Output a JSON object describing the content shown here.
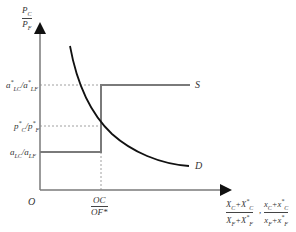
{
  "diagram": {
    "y_axis": {
      "label_num": "P",
      "label_num_sub": "C",
      "label_den": "P",
      "label_den_sub": "F"
    },
    "x_axis": {
      "label1_num": "X_C + X*_C",
      "label1_den": "X_F + X*_F",
      "label2_num": "x_C + x*_C",
      "label2_den": "x_F + x*_F",
      "separator": ","
    },
    "origin": "O",
    "y_ticks": {
      "upper": "a*_LC / a*_LF",
      "middle": "p*_C / p*_F",
      "lower": "a_LC / a_LF"
    },
    "x_tick": {
      "num": "OC",
      "den": "OF*"
    },
    "curves": {
      "supply": "S",
      "demand": "D"
    },
    "colors": {
      "supply": "#7a7a7a",
      "demand": "#111111",
      "axis": "#7a7a7a",
      "dashed": "#888888"
    }
  }
}
